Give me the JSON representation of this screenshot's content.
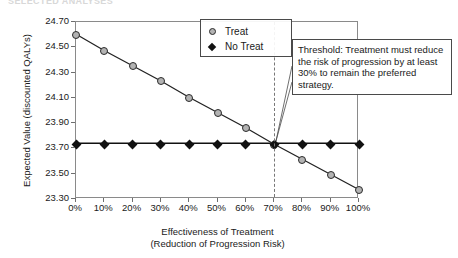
{
  "figure": {
    "title_remnant": "SELECTED ANALYSES",
    "background": "#ffffff"
  },
  "legend": {
    "position": "inside-top-center",
    "entries": [
      {
        "label": "Treat",
        "marker": "circle-gray",
        "color": "#b3b3b3"
      },
      {
        "label": "No Treat",
        "marker": "diamond-black",
        "color": "#111111"
      }
    ]
  },
  "annotation": {
    "text": "Threshold: Treatment must reduce the risk of progression by at least 30% to remain the preferred strategy.",
    "points_to_x": "70%"
  },
  "chart_data": {
    "type": "line",
    "title": "",
    "xlabel": "Effectiveness of Treatment",
    "xlabel_line2": "(Reduction of Progression Risk)",
    "ylabel": "Expected Value (discounted QALYs)",
    "x": [
      0,
      10,
      20,
      30,
      40,
      50,
      60,
      70,
      80,
      90,
      100
    ],
    "xtick_labels": [
      "0%",
      "10%",
      "20%",
      "30%",
      "40%",
      "50%",
      "60%",
      "70%",
      "80%",
      "90%",
      "100%"
    ],
    "xlim": [
      0,
      100
    ],
    "ylim": [
      23.3,
      24.7
    ],
    "ytick_labels": [
      "24.70",
      "24.50",
      "24.30",
      "24.10",
      "23.90",
      "23.70",
      "23.50",
      "23.30"
    ],
    "ytick_values": [
      24.7,
      24.5,
      24.3,
      24.1,
      23.9,
      23.7,
      23.5,
      23.3
    ],
    "grid": false,
    "legend_position": "top-center",
    "series": [
      {
        "name": "Treat",
        "marker": "circle",
        "color": "#b3b3b3",
        "line_color": "#222222",
        "values": [
          24.6,
          24.47,
          24.35,
          24.23,
          24.1,
          23.98,
          23.86,
          23.73,
          23.61,
          23.49,
          23.37
        ]
      },
      {
        "name": "No Treat",
        "marker": "diamond",
        "color": "#111111",
        "line_color": "#111111",
        "values": [
          23.73,
          23.73,
          23.73,
          23.73,
          23.73,
          23.73,
          23.73,
          23.73,
          23.73,
          23.73,
          23.73
        ]
      }
    ],
    "threshold": {
      "x": 70,
      "style": "dashed",
      "color": "#777777",
      "label": "70%"
    }
  }
}
